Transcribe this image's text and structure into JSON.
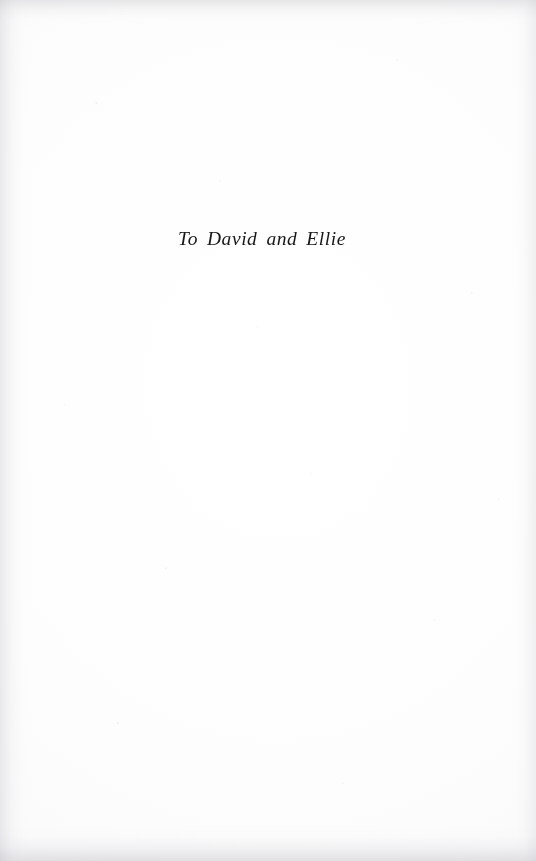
{
  "page": {
    "kind": "book-dedication-page",
    "background_color": "#fefefe",
    "ink_color": "#181818",
    "edge_shadow_color": "#c4c4c8"
  },
  "dedication": {
    "text": "To David and Ellie"
  }
}
